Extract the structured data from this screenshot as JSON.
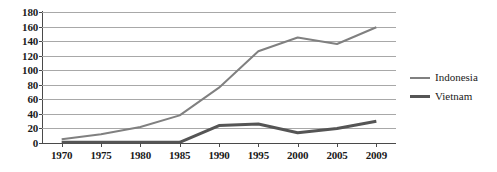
{
  "chart_data": {
    "type": "line",
    "title": "",
    "xlabel": "",
    "ylabel": "",
    "categories": [
      "1970",
      "1975",
      "1980",
      "1985",
      "1990",
      "1995",
      "2000",
      "2005",
      "2009"
    ],
    "series": [
      {
        "name": "Indonesia",
        "values": [
          5,
          12,
          22,
          38,
          76,
          126,
          145,
          136,
          159
        ],
        "color": "#808080",
        "line_width": 2
      },
      {
        "name": "Vietnam",
        "values": [
          1,
          1,
          1,
          1,
          24,
          26,
          14,
          20,
          30
        ],
        "color": "#555555",
        "line_width": 3
      }
    ],
    "ylim": [
      0,
      180
    ],
    "ytick_step": 20,
    "yticks": [
      0,
      20,
      40,
      60,
      80,
      100,
      120,
      140,
      160,
      180
    ],
    "grid": true,
    "legend_position": "right",
    "axis_color": "#4a4a4a",
    "gridline_color": "#a8a8a8",
    "background": "#ffffff"
  },
  "legend": {
    "entries": [
      {
        "label": "Indonesia",
        "swatch": "line-swatch-thin"
      },
      {
        "label": "Vietnam",
        "swatch": "line-swatch-thick"
      }
    ]
  }
}
